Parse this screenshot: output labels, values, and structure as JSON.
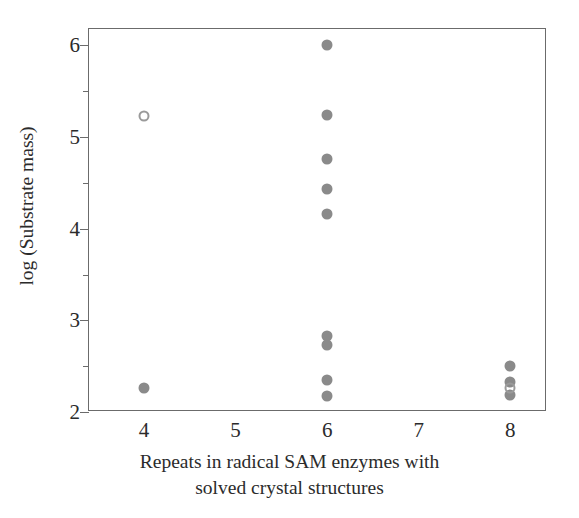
{
  "chart_data": {
    "type": "scatter",
    "title": "",
    "xlabel": "Repeats in radical SAM enzymes with solved crystal structures",
    "xlabel_lines": [
      "Repeats in radical SAM enzymes with",
      "solved crystal structures"
    ],
    "ylabel": "log (Substrate mass)",
    "xlim": [
      3.4,
      8.4
    ],
    "ylim": [
      2.0,
      6.18
    ],
    "grid": false,
    "legend": null,
    "xticks": [
      4,
      5,
      6,
      7,
      8
    ],
    "xtick_labels": [
      "4",
      "5",
      "6",
      "7",
      "8"
    ],
    "yticks": [
      2,
      3,
      4,
      5,
      6
    ],
    "ytick_labels": [
      "2",
      "3",
      "4",
      "5",
      "6"
    ],
    "yticks_minor": [
      2.5,
      3.5,
      4.5,
      5.5
    ],
    "marker_color": "#8a8a8a",
    "open_marker_color": "#9a9a9a",
    "axis_color": "#6b6b6b",
    "series": [
      {
        "name": "filled",
        "style": "filled",
        "points": [
          {
            "x": 4,
            "y": 2.26
          },
          {
            "x": 6,
            "y": 6.01
          },
          {
            "x": 6,
            "y": 5.24
          },
          {
            "x": 6,
            "y": 4.76
          },
          {
            "x": 6,
            "y": 4.43
          },
          {
            "x": 6,
            "y": 4.16
          },
          {
            "x": 6,
            "y": 2.83
          },
          {
            "x": 6,
            "y": 2.73
          },
          {
            "x": 6,
            "y": 2.35
          },
          {
            "x": 6,
            "y": 2.18
          },
          {
            "x": 8,
            "y": 2.5
          },
          {
            "x": 8,
            "y": 2.33
          },
          {
            "x": 8,
            "y": 2.19
          }
        ]
      },
      {
        "name": "open",
        "style": "open",
        "points": [
          {
            "x": 4,
            "y": 5.23
          },
          {
            "x": 8,
            "y": 2.26
          }
        ]
      }
    ]
  }
}
